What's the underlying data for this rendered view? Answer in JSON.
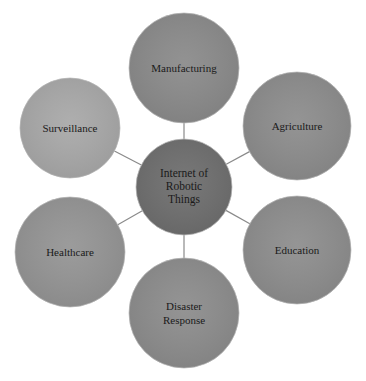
{
  "diagram": {
    "center": {
      "lines": [
        "Internet of",
        "Robotic",
        "Things"
      ],
      "color": "#6f6f6f"
    },
    "nodes": [
      {
        "id": "manufacturing",
        "lines": [
          "Manufacturing"
        ],
        "color": "#8b8b8b"
      },
      {
        "id": "agriculture",
        "lines": [
          "Agriculture"
        ],
        "color": "#8d8d8d"
      },
      {
        "id": "education",
        "lines": [
          "Education"
        ],
        "color": "#8e8e8e"
      },
      {
        "id": "disaster-response",
        "lines": [
          "Disaster",
          "Response"
        ],
        "color": "#8d8d8d"
      },
      {
        "id": "healthcare",
        "lines": [
          "Healthcare"
        ],
        "color": "#959595"
      },
      {
        "id": "surveillance",
        "lines": [
          "Surveillance"
        ],
        "color": "#a9a9a9"
      }
    ],
    "connector_color": "#8a8a8a"
  }
}
